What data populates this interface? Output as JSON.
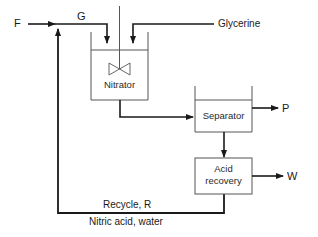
{
  "diagram": {
    "type": "process-flow",
    "colors": {
      "line": "#1a1a1a",
      "box_stroke": "#555555",
      "text": "#1a1a1a"
    },
    "units": [
      {
        "id": "nitrator",
        "label": "Nitrator",
        "kind": "stirred-vessel"
      },
      {
        "id": "separator",
        "label": "Separator",
        "kind": "open-vessel"
      },
      {
        "id": "acid_recovery",
        "label": "Acid\nrecovery",
        "line1": "Acid",
        "line2": "recovery",
        "kind": "box"
      }
    ],
    "streams": {
      "feed": "F",
      "combined_feed": "G",
      "glycerine": "Glycerine",
      "product": "P",
      "waste": "W",
      "recycle": "Recycle, R",
      "recycle_composition": "Nitric acid, water"
    },
    "connections": [
      {
        "from": "F",
        "to": "G",
        "label": "F"
      },
      {
        "from": "recycle",
        "to": "G",
        "label": "Recycle, R"
      },
      {
        "from": "G",
        "to": "nitrator"
      },
      {
        "from": "glycerine",
        "to": "nitrator",
        "label": "Glycerine"
      },
      {
        "from": "nitrator",
        "to": "separator"
      },
      {
        "from": "separator",
        "to": "P",
        "label": "P"
      },
      {
        "from": "separator",
        "to": "acid_recovery"
      },
      {
        "from": "acid_recovery",
        "to": "W",
        "label": "W"
      },
      {
        "from": "acid_recovery",
        "to": "recycle",
        "label": "Recycle, R"
      }
    ]
  }
}
